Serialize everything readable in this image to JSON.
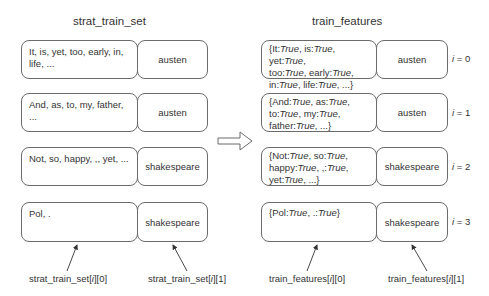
{
  "left": {
    "title": "strat_train_set",
    "rows": [
      {
        "text": "It, is, yet, too, early, in, life, ...",
        "label": "austen"
      },
      {
        "text": "And, as, to, my, father, ...",
        "label": "austen"
      },
      {
        "text": "Not, so, happy, ,, yet, ...",
        "label": "shakespeare"
      },
      {
        "text": "Pol, .",
        "label": "shakespeare"
      }
    ],
    "pointer_labels": [
      "strat_train_set[i][0]",
      "strat_train_set[i][1]"
    ]
  },
  "right": {
    "title": "train_features",
    "rows": [
      {
        "text_parts": [
          [
            "It:",
            "True"
          ],
          [
            ", is:",
            "True"
          ],
          [
            ", yet:",
            "True"
          ],
          [
            ", too:",
            "True"
          ],
          [
            ", early:",
            "True"
          ],
          [
            ", in:",
            "True"
          ],
          [
            ", life:",
            "True"
          ],
          [
            ", ...}",
            ""
          ]
        ],
        "lines": [
          "{It:|True|, is:|True|, yet:|True|,",
          "too:|True|, early:|True|,",
          "in:|True|, life:|True|, ...}"
        ],
        "label": "austen",
        "index": "i = 0"
      },
      {
        "lines": [
          "{And:|True|, as:|True|,",
          "to:|True|, my:|True|,",
          "father:|True|, ...}"
        ],
        "label": "austen",
        "index": "i = 1"
      },
      {
        "lines": [
          "{Not:|True|, so:|True|,",
          "happy:|True|, ,:|True|,",
          "yet:|True|, ...}"
        ],
        "label": "shakespeare",
        "index": "i = 2"
      },
      {
        "lines": [
          "{Pol:|True|, .:|True|}"
        ],
        "label": "shakespeare",
        "index": "i = 3"
      }
    ],
    "pointer_labels": [
      "train_features[i][0]",
      "train_features[i][1]"
    ]
  },
  "transform_arrow": "hollow-right-arrow",
  "colors": {
    "stroke": "#6b6b6b",
    "text": "#333333",
    "background": "#ffffff"
  }
}
